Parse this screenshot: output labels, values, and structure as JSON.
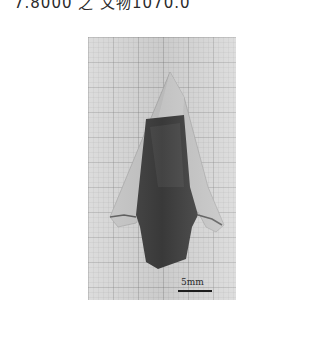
{
  "caption": {
    "text": "7.8000 之 文物1070.0",
    "truncated": true
  },
  "figure": {
    "background": "graph-paper grid",
    "colors": {
      "paper": "#d6d6d6",
      "grid": "#8a8a8a",
      "tip": "#bdbdbd",
      "stem": "#3c3c3c"
    },
    "scale_bar": {
      "label": "5mm",
      "color": "#1e1e1e"
    }
  }
}
